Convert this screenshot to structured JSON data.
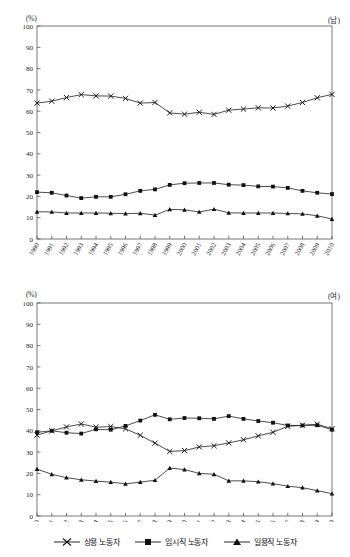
{
  "page": {
    "unit_label": "(%)",
    "panel_male_label": "(남)",
    "panel_female_label": "(여)"
  },
  "legend": {
    "position": "bottom-center",
    "items": [
      {
        "label": "상용 노동자",
        "marker": "x-marker-icon",
        "color": "#111111"
      },
      {
        "label": "임시직 노동자",
        "marker": "square-marker-icon",
        "color": "#111111"
      },
      {
        "label": "일용직 노동자",
        "marker": "triangle-marker-icon",
        "color": "#111111"
      }
    ]
  },
  "axis": {
    "y_ticks": [
      "0",
      "10",
      "20",
      "30",
      "40",
      "50",
      "60",
      "70",
      "80",
      "90",
      "100"
    ],
    "x_ticks": [
      "1990",
      "1991",
      "1992",
      "1993",
      "1994",
      "1995",
      "1996",
      "1997",
      "1998",
      "1999",
      "2000",
      "2001",
      "2002",
      "2003",
      "2004",
      "2005",
      "2006",
      "2007",
      "2008",
      "2009",
      "2010"
    ]
  },
  "chart_data": [
    {
      "type": "line",
      "title": "",
      "panel": "(남)",
      "xlabel": "",
      "ylabel": "(%)",
      "ylim": [
        0,
        100
      ],
      "grid": false,
      "legend_position": "bottom-center",
      "x": [
        "1990",
        "1991",
        "1992",
        "1993",
        "1994",
        "1995",
        "1996",
        "1997",
        "1998",
        "1999",
        "2000",
        "2001",
        "2002",
        "2003",
        "2004",
        "2005",
        "2006",
        "2007",
        "2008",
        "2009",
        "2010"
      ],
      "series": [
        {
          "name": "상용 노동자",
          "marker": "x",
          "values": [
            63.8,
            64.7,
            66.4,
            67.8,
            67.2,
            67.1,
            66.0,
            63.8,
            64.1,
            59.2,
            58.6,
            59.5,
            58.5,
            60.5,
            61.0,
            61.6,
            61.5,
            62.4,
            64.1,
            66.3,
            67.9
          ]
        },
        {
          "name": "임시직 노동자",
          "marker": "square",
          "values": [
            22.0,
            21.7,
            20.4,
            19.2,
            19.8,
            19.8,
            21.0,
            22.6,
            23.3,
            25.4,
            26.2,
            26.3,
            26.3,
            25.5,
            25.3,
            24.7,
            24.6,
            24.0,
            22.6,
            21.7,
            21.1
          ]
        },
        {
          "name": "일용직 노동자",
          "marker": "triangle",
          "values": [
            12.8,
            12.7,
            12.2,
            12.2,
            12.2,
            12.1,
            11.9,
            12.1,
            11.2,
            13.9,
            13.7,
            12.7,
            14.0,
            12.3,
            12.2,
            12.2,
            12.2,
            12.0,
            11.8,
            10.9,
            9.4
          ]
        }
      ]
    },
    {
      "type": "line",
      "title": "",
      "panel": "(여)",
      "xlabel": "",
      "ylabel": "(%)",
      "ylim": [
        0,
        100
      ],
      "grid": false,
      "legend_position": "bottom-center",
      "x": [
        "1990",
        "1991",
        "1992",
        "1993",
        "1994",
        "1995",
        "1996",
        "1997",
        "1998",
        "1999",
        "2000",
        "2001",
        "2002",
        "2003",
        "2004",
        "2005",
        "2006",
        "2007",
        "2008",
        "2009",
        "2010"
      ],
      "series": [
        {
          "name": "상용 노동자",
          "marker": "x",
          "values": [
            38.0,
            40.0,
            41.8,
            43.2,
            41.7,
            42.0,
            40.9,
            37.9,
            34.2,
            30.3,
            30.7,
            32.4,
            33.0,
            34.3,
            35.8,
            37.6,
            39.3,
            42.1,
            42.6,
            43.1,
            41.0
          ]
        },
        {
          "name": "임시직 노동자",
          "marker": "square",
          "values": [
            39.3,
            40.0,
            39.1,
            38.7,
            40.7,
            40.5,
            42.3,
            44.8,
            47.5,
            45.4,
            46.0,
            45.9,
            45.6,
            46.9,
            45.6,
            44.6,
            43.8,
            42.5,
            42.5,
            42.6,
            40.5
          ]
        },
        {
          "name": "일용직 노동자",
          "marker": "triangle",
          "values": [
            22.0,
            19.6,
            18.0,
            17.0,
            16.4,
            15.9,
            15.1,
            15.9,
            16.8,
            22.5,
            21.8,
            20.0,
            19.6,
            16.5,
            16.5,
            16.1,
            15.2,
            14.0,
            13.3,
            11.9,
            10.5
          ]
        }
      ]
    }
  ]
}
